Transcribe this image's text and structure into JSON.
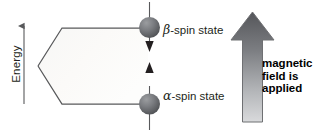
{
  "diagram": {
    "axis": {
      "name": "energy-axis",
      "label": "Energy",
      "direction": "up",
      "icon": "up-arrow-icon"
    },
    "levels": [
      {
        "id": "beta",
        "label": "β-spin state",
        "symbol": "β",
        "label_text": "-spin state",
        "position": "upper",
        "spin_arrow": "down-arrow-icon",
        "sphere_color": "#6e7074"
      },
      {
        "id": "alpha",
        "label": "α-spin state",
        "symbol": "α",
        "label_text": "-spin state",
        "position": "lower",
        "spin_arrow": "up-arrow-icon",
        "sphere_color": "#6e7074"
      }
    ],
    "splitting_gap_arrow": {
      "name": "energy-gap-double-arrow",
      "icon": "double-headed-vertical-arrow-icon"
    },
    "field_arrow": {
      "name": "magnetic-field-arrow",
      "icon": "big-up-arrow-icon",
      "gradient_top": "#58595b",
      "gradient_bottom": "#d5d6d8"
    },
    "caption": {
      "line1": "magnetic",
      "line2": "field is",
      "line3": "applied"
    },
    "colors": {
      "line": "#58595b",
      "text": "#231f20",
      "wedge_fill": "#fbfbfa"
    }
  }
}
